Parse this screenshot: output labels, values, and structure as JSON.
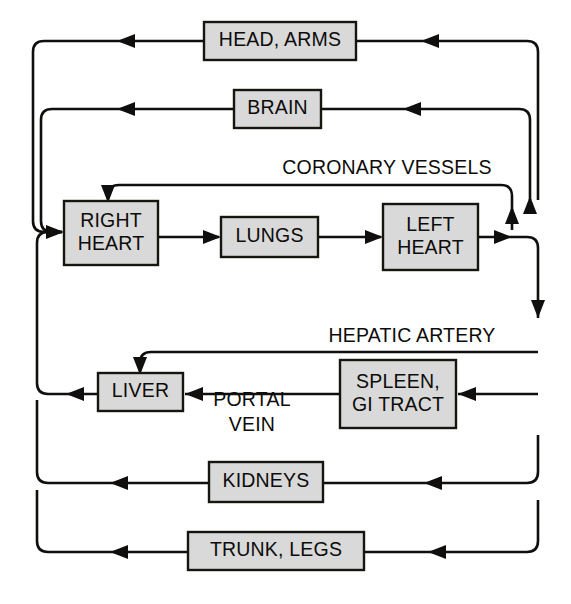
{
  "diagram": {
    "background_color": "#ffffff",
    "line_color": "#100f0d",
    "box_fill_color": "#d9d9d9",
    "box_stroke_color": "#16150f",
    "text_color": "#0d0c0a",
    "nodes": [
      {
        "id": "head_arms",
        "label": "HEAD, ARMS",
        "lines": [
          "HEAD, ARMS"
        ],
        "x": 204,
        "y": 22,
        "w": 152,
        "h": 38
      },
      {
        "id": "brain",
        "label": "BRAIN",
        "lines": [
          "BRAIN"
        ],
        "x": 234,
        "y": 90,
        "w": 87,
        "h": 38
      },
      {
        "id": "right_heart",
        "label": "RIGHT HEART",
        "lines": [
          "RIGHT",
          "HEART"
        ],
        "x": 64,
        "y": 201,
        "w": 94,
        "h": 64
      },
      {
        "id": "lungs",
        "label": "LUNGS",
        "lines": [
          "LUNGS"
        ],
        "x": 221,
        "y": 217,
        "w": 97,
        "h": 40
      },
      {
        "id": "left_heart",
        "label": "LEFT HEART",
        "lines": [
          "LEFT",
          "HEART"
        ],
        "x": 383,
        "y": 204,
        "w": 95,
        "h": 66
      },
      {
        "id": "liver",
        "label": "LIVER",
        "lines": [
          "LIVER"
        ],
        "x": 98,
        "y": 373,
        "w": 85,
        "h": 38
      },
      {
        "id": "spleen_gi",
        "label": "SPLEEN, GI TRACT",
        "lines": [
          "SPLEEN,",
          "GI TRACT"
        ],
        "x": 340,
        "y": 360,
        "w": 116,
        "h": 68
      },
      {
        "id": "kidneys",
        "label": "KIDNEYS",
        "lines": [
          "KIDNEYS"
        ],
        "x": 209,
        "y": 462,
        "w": 114,
        "h": 40
      },
      {
        "id": "trunk_legs",
        "label": "TRUNK, LEGS",
        "lines": [
          "TRUNK, LEGS"
        ],
        "x": 188,
        "y": 532,
        "w": 176,
        "h": 38
      }
    ],
    "vessel_labels": [
      {
        "id": "coronary",
        "lines": [
          "CORONARY VESSELS"
        ],
        "x": 387,
        "y": 169
      },
      {
        "id": "hepatic_artery",
        "lines": [
          "HEPATIC ARTERY"
        ],
        "x": 412,
        "y": 337
      },
      {
        "id": "portal_vein",
        "lines": [
          "PORTAL",
          "VEIN"
        ],
        "x": 252,
        "y": 401
      }
    ]
  }
}
